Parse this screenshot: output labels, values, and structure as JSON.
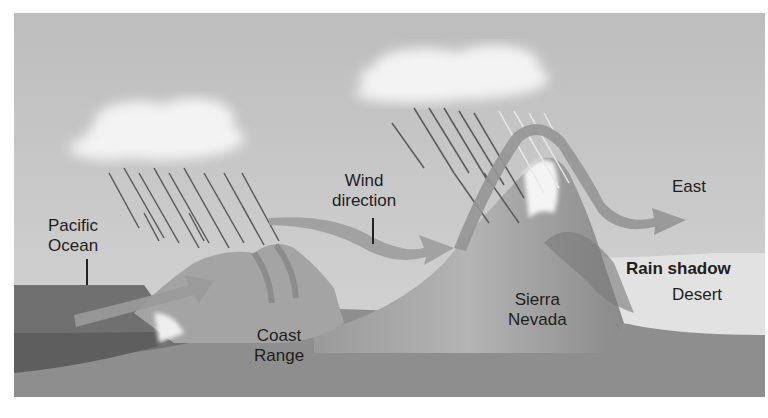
{
  "diagram": {
    "labels": {
      "pacific_ocean": [
        "Pacific",
        "Ocean"
      ],
      "wind_direction": [
        "Wind",
        "direction"
      ],
      "east": "East",
      "coast_range": [
        "Coast",
        "Range"
      ],
      "sierra_nevada": [
        "Sierra",
        "Nevada"
      ],
      "rain_shadow": "Rain shadow",
      "desert": "Desert"
    },
    "elements": [
      "cloud-left",
      "cloud-center",
      "rain-left",
      "rain-center",
      "ocean",
      "coast-range-mountains",
      "sierra-nevada-peak",
      "wind-arrow",
      "rain-shadow-desert"
    ],
    "colors": {
      "sky": "#c8c8c8",
      "cloud": "#f2f2f2",
      "ocean": "#6f6f6f",
      "land": "#8c8c8c",
      "mountain": "#a8a8a8",
      "wind_arrow": "#9a9a9a",
      "desert": "#e2e2e2",
      "text": "#1e1e1e"
    }
  }
}
